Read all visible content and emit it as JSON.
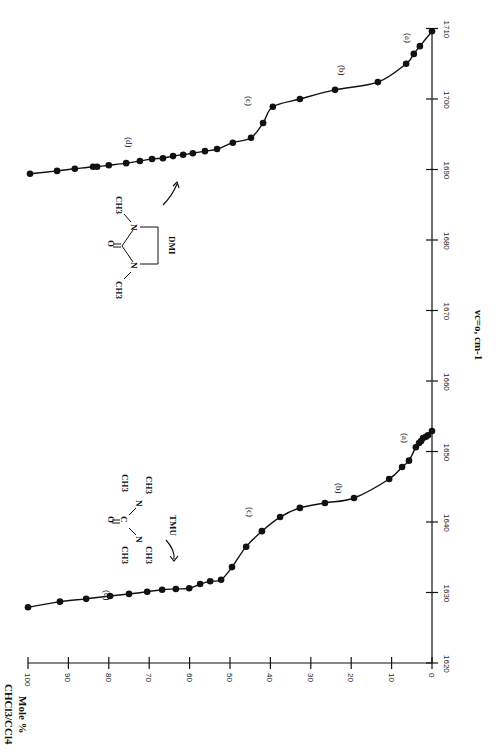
{
  "chart_data": {
    "type": "line",
    "orientation": "rotated-90",
    "title": "",
    "xlabel": "Mole % CHCl3/CCl4",
    "ylabel": "ν C=O, cm⁻¹",
    "xlim": [
      0,
      100
    ],
    "ylim": [
      1620,
      1710
    ],
    "x_ticks": [
      0,
      10,
      20,
      30,
      40,
      50,
      60,
      70,
      80,
      90,
      100
    ],
    "y_ticks": [
      1620,
      1630,
      1640,
      1650,
      1660,
      1670,
      1680,
      1690,
      1700,
      1710
    ],
    "grid": false,
    "legend": null,
    "series": [
      {
        "name": "TMU",
        "marker": "filled-circle",
        "x": [
          100,
          92.1,
          85.6,
          79.7,
          75.0,
          70.5,
          66.8,
          63.4,
          60.1,
          57.4,
          54.9,
          52.2,
          49.5,
          46.0,
          42.1,
          37.6,
          32.7,
          26.5,
          19.3,
          10.6,
          7.4,
          5.7,
          4.0,
          3.2,
          2.7,
          2.2,
          1.5,
          1.0,
          0
        ],
        "values": [
          1627.9,
          1628.7,
          1629.1,
          1629.5,
          1629.8,
          1630.1,
          1630.4,
          1630.5,
          1630.6,
          1631.2,
          1631.6,
          1631.8,
          1633.6,
          1636.5,
          1638.7,
          1640.7,
          1642.0,
          1642.7,
          1643.4,
          1646.1,
          1647.8,
          1648.7,
          1650.6,
          1651.2,
          1651.5,
          1651.9,
          1652.1,
          1652.3,
          1652.9
        ]
      },
      {
        "name": "DMI",
        "marker": "filled-circle",
        "x": [
          99.5,
          92.8,
          88.4,
          83.9,
          82.9,
          80.0,
          75.7,
          72.3,
          69.3,
          66.6,
          64.1,
          61.6,
          59.2,
          56.2,
          53.2,
          49.3,
          44.8,
          41.8,
          39.4,
          32.7,
          24.0,
          13.4,
          6.4,
          4.5,
          3.0,
          0
        ],
        "values": [
          1689.4,
          1689.8,
          1690.1,
          1690.4,
          1690.4,
          1690.6,
          1690.9,
          1691.2,
          1691.5,
          1691.6,
          1691.9,
          1692.1,
          1692.3,
          1692.6,
          1692.9,
          1693.8,
          1694.5,
          1696.6,
          1698.9,
          1700.0,
          1701.3,
          1702.4,
          1705.0,
          1706.4,
          1707.5,
          1709.6
        ]
      }
    ],
    "annotations": [
      {
        "text": "(a)",
        "series": "TMU",
        "region": "0-5 mole %"
      },
      {
        "text": "(b)",
        "series": "TMU",
        "region": "~15-30 mole %"
      },
      {
        "text": "(c)",
        "series": "TMU",
        "region": "~40-50 mole %"
      },
      {
        "text": "(d)",
        "series": "TMU",
        "region": "~55-100 mole %"
      },
      {
        "text": "(a)",
        "series": "DMI",
        "region": "0-5 mole %"
      },
      {
        "text": "(b)",
        "series": "DMI",
        "region": "~10-30 mole %"
      },
      {
        "text": "(c)",
        "series": "DMI",
        "region": "~35-45 mole %"
      },
      {
        "text": "(d)",
        "series": "DMI",
        "region": "~50-100 mole %"
      },
      {
        "text": "TMU",
        "type": "structure-label"
      },
      {
        "text": "DMI",
        "type": "structure-label"
      }
    ]
  },
  "labels": {
    "x_title_line1": "Mole %",
    "x_title_line2": "CHCl3/CCl4",
    "y_title": "νc=o, cm-1",
    "tmu": "TMU",
    "dmi": "DMI",
    "a": "(a)",
    "b": "(b)",
    "c": "(c)",
    "d": "(d)"
  },
  "structures": {
    "tmu": {
      "o": "O",
      "c": "C",
      "n": "N",
      "ch3": "CH3"
    },
    "dmi": {
      "o": "O",
      "n": "N",
      "ch3": "CH3"
    }
  }
}
